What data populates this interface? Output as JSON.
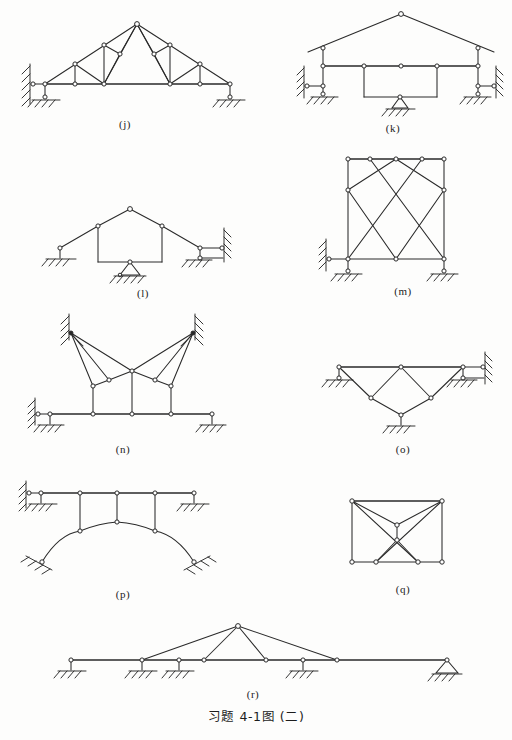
{
  "document": {
    "caption": "习题 4-1图 (二)",
    "caption_parts": {
      "prefix": "习题",
      "number": "4-1",
      "fig_word": "图",
      "part": "(二)"
    },
    "page_background": "#fdfdfc",
    "ink_color": "#2a2a2a"
  },
  "figures": [
    {
      "id": "j",
      "label": "(j)",
      "description": "symmetric roof truss with inclined top chords, horizontal bottom chord, vertical posts and diagonal web members",
      "supports": [
        "wall-link-left",
        "pin-left-ground",
        "pin-right-ground"
      ],
      "label_x": 122,
      "label_y": 118
    },
    {
      "id": "k",
      "label": "(k)",
      "description": "gabled frame with two columns, horizontal tie beam, suspended rectangular sub-frame on central pin support",
      "supports": [
        "wall-link-left",
        "pin-left-ground",
        "pin-center-triangle",
        "wall-link-right",
        "pin-right-ground"
      ],
      "label_x": 392,
      "label_y": 122
    },
    {
      "id": "l",
      "label": "(l)",
      "description": "gabled frame with two vertical legs, a central pin support under the span, roller at left and double horizontal links to wall at right",
      "supports": [
        "pin-left-ground",
        "pin-center-triangle",
        "wall-links-right"
      ],
      "label_x": 142,
      "label_y": 287
    },
    {
      "id": "m",
      "label": "(m)",
      "description": "rectangular braced frame with two X cross bracing panels, two columns and top and bottom chords",
      "supports": [
        "wall-link-left",
        "pin-left-ground",
        "pin-right-ground"
      ],
      "label_x": 402,
      "label_y": 292
    },
    {
      "id": "n",
      "label": "(n)",
      "description": "cable stayed style frame: two inclined fixed wall supports at top with fan of stays down to a deck carried on three posts",
      "supports": [
        "fixed-wall-top-left",
        "fixed-wall-top-right",
        "wall-link-left",
        "pin-left-ground",
        "pin-right-ground"
      ],
      "label_x": 122,
      "label_y": 447
    },
    {
      "id": "o",
      "label": "(o)",
      "description": "underslung trussed beam: straight top chord with V shaped web members down to a central pin support",
      "supports": [
        "pin-left-ground",
        "pin-center-bottom",
        "wall-links-right"
      ],
      "label_x": 402,
      "label_y": 447
    },
    {
      "id": "p",
      "label": "(p)",
      "description": "deck beam on hangers supported by a two hinged parabolic arch with inclined abutments",
      "supports": [
        "wall-link-left",
        "pin-left-ground",
        "pin-right-ground",
        "arch-abutment-left",
        "arch-abutment-right"
      ],
      "label_x": 122,
      "label_y": 592
    },
    {
      "id": "q",
      "label": "(q)",
      "description": "rectangular truss panel with internal bow tie bracing and two interior nodes joined by a short vertical link",
      "supports": [],
      "label_x": 402,
      "label_y": 588
    },
    {
      "id": "r",
      "label": "(r)",
      "description": "long multi-span beam on five supports with a raised central king post triangle and pin support at the right end",
      "supports": [
        "pin-1",
        "pin-2",
        "pin-3",
        "pin-4",
        "pin-triangle-right"
      ],
      "label_x": 252,
      "label_y": 690
    }
  ]
}
